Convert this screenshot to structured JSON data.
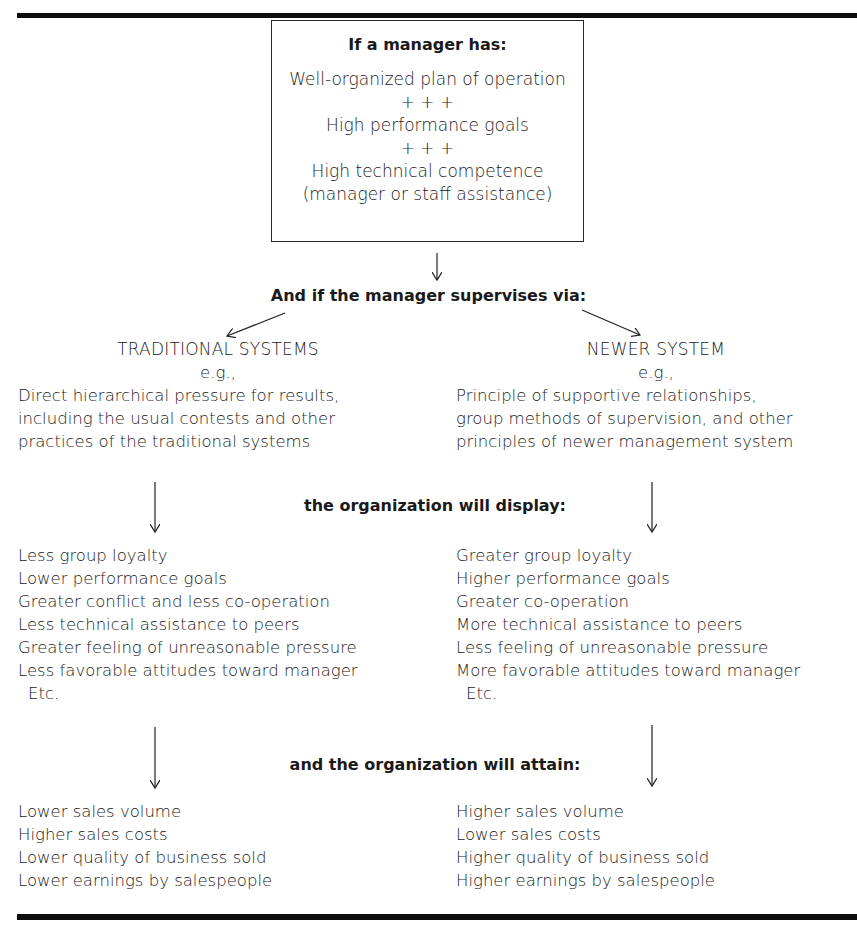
{
  "diagram": {
    "condition_box": {
      "heading": "If a manager has:",
      "lines": [
        "Well-organized plan of operation",
        "+ + +",
        "High performance goals",
        "+ + +",
        "High technical competence",
        "(manager or staff assistance)"
      ]
    },
    "supervision_heading": "And if the manager supervises via:",
    "traditional": {
      "title": "TRADITIONAL SYSTEMS",
      "eg": "e.g.,",
      "description": [
        "Direct hierarchical pressure for results,",
        "including the usual contests and other",
        "practices of the traditional systems"
      ],
      "display": [
        "Less group loyalty",
        "Lower performance goals",
        "Greater conflict and less co-operation",
        "Less technical assistance to peers",
        "Greater feeling of unreasonable pressure",
        "Less favorable attitudes toward manager",
        "Etc."
      ],
      "attain": [
        "Lower sales volume",
        "Higher sales costs",
        "Lower quality of business sold",
        "Lower earnings by salespeople"
      ]
    },
    "newer": {
      "title": "NEWER SYSTEM",
      "eg": "e.g.,",
      "description": [
        "Principle of supportive relationships,",
        "group methods of supervision, and other",
        "principles of newer management system"
      ],
      "display": [
        "Greater group loyalty",
        "Higher performance goals",
        "Greater co-operation",
        "More technical assistance to peers",
        "Less feeling of unreasonable pressure",
        "More favorable attitudes toward manager",
        "Etc."
      ],
      "attain": [
        "Higher sales volume",
        "Lower sales costs",
        "Higher quality of business sold",
        "Higher earnings by salespeople"
      ]
    },
    "display_heading": "the organization will display:",
    "attain_heading": "and the organization will attain:"
  }
}
